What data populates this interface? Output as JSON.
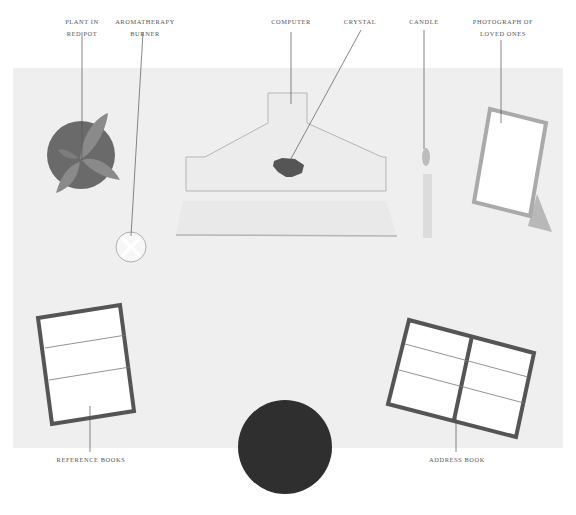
{
  "diagram": {
    "colors": {
      "desk_surface": "#efefef",
      "background": "#ffffff",
      "leader_line": "#555555",
      "pot": "#6a6a6a",
      "leaf": "#8a8a8a",
      "monitor_fill": "#ececec",
      "monitor_stroke": "#b5b5b5",
      "crystal": "#555555",
      "candle": "#dcdcdc",
      "flame": "#bdbdbd",
      "frame_stroke": "#aaaaaa",
      "book_stroke": "#555555",
      "chair": "#2f2f2f"
    },
    "labels": {
      "plant": [
        "PLANT IN",
        "RED POT"
      ],
      "aromatherapy": [
        "AROMATHERAPY",
        "BURNER"
      ],
      "computer": [
        "COMPUTER"
      ],
      "crystal": [
        "CRYSTAL"
      ],
      "candle": [
        "CANDLE"
      ],
      "photograph": [
        "PHOTOGRAPH OF",
        "LOVED ONES"
      ],
      "reference_books": [
        "REFERENCE BOOKS"
      ],
      "address_book": [
        "ADDRESS BOOK"
      ]
    }
  }
}
